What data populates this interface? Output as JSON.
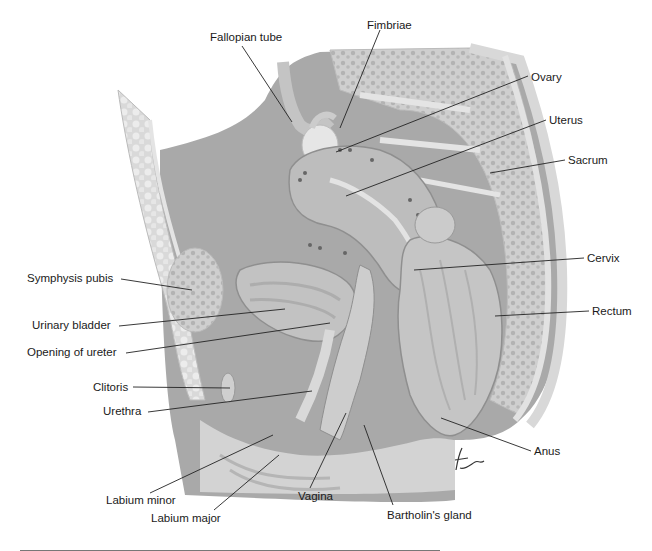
{
  "figure": {
    "signature": "time"
  },
  "labels": [
    {
      "id": "fallopian-tube",
      "text": "Fallopian tube",
      "side": "top"
    },
    {
      "id": "fimbriae",
      "text": "Fimbriae",
      "side": "top"
    },
    {
      "id": "ovary",
      "text": "Ovary",
      "side": "right"
    },
    {
      "id": "uterus",
      "text": "Uterus",
      "side": "right"
    },
    {
      "id": "sacrum",
      "text": "Sacrum",
      "side": "right"
    },
    {
      "id": "cervix",
      "text": "Cervix",
      "side": "right"
    },
    {
      "id": "rectum",
      "text": "Rectum",
      "side": "right"
    },
    {
      "id": "anus",
      "text": "Anus",
      "side": "right"
    },
    {
      "id": "symphysis-pubis",
      "text": "Symphysis pubis",
      "side": "left"
    },
    {
      "id": "urinary-bladder",
      "text": "Urinary bladder",
      "side": "left"
    },
    {
      "id": "opening-of-ureter",
      "text": "Opening of ureter",
      "side": "left"
    },
    {
      "id": "clitoris",
      "text": "Clitoris",
      "side": "left"
    },
    {
      "id": "urethra",
      "text": "Urethra",
      "side": "left"
    },
    {
      "id": "labium-minor",
      "text": "Labium minor",
      "side": "bottom"
    },
    {
      "id": "labium-major",
      "text": "Labium major",
      "side": "bottom"
    },
    {
      "id": "vagina",
      "text": "Vagina",
      "side": "bottom"
    },
    {
      "id": "bartholins-gland",
      "text": "Bartholin's gland",
      "side": "bottom"
    }
  ],
  "colors": {
    "background_tissue": "#a9a9a9",
    "light_tissue": "#d4d4d4",
    "bone": "#c8c8c8",
    "leader_line": "#222222",
    "text": "#1a1a1a"
  }
}
